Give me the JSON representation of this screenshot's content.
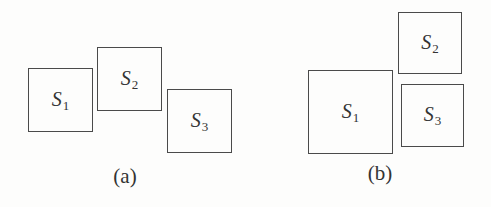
{
  "figure": {
    "panels": [
      {
        "caption": "(a)",
        "caption_pos": {
          "x": 125,
          "y": 166
        },
        "boxes": [
          {
            "name": "S",
            "sub": "1",
            "left": 28,
            "top": 68,
            "width": 65,
            "height": 64
          },
          {
            "name": "S",
            "sub": "2",
            "left": 97,
            "top": 47,
            "width": 65,
            "height": 64
          },
          {
            "name": "S",
            "sub": "3",
            "left": 167,
            "top": 89,
            "width": 65,
            "height": 64
          }
        ]
      },
      {
        "caption": "(b)",
        "caption_pos": {
          "x": 380,
          "y": 163
        },
        "boxes": [
          {
            "name": "S",
            "sub": "1",
            "left": 308,
            "top": 70,
            "width": 85,
            "height": 84
          },
          {
            "name": "S",
            "sub": "2",
            "left": 398,
            "top": 12,
            "width": 64,
            "height": 62
          },
          {
            "name": "S",
            "sub": "3",
            "left": 401,
            "top": 84,
            "width": 63,
            "height": 63
          }
        ]
      }
    ]
  },
  "colors": {
    "stroke": "#4a4a4a",
    "text": "#333333",
    "background": "#ffffff"
  }
}
